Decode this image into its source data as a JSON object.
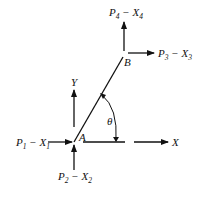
{
  "diagram": {
    "points": {
      "A": {
        "label": "A"
      },
      "B": {
        "label": "B"
      }
    },
    "axes": {
      "x_label": "X",
      "y_label": "Y"
    },
    "angle_label": "θ",
    "forces": [
      {
        "id": "1",
        "P": "P",
        "P_sub": "1",
        "dash": " − ",
        "X": "X",
        "X_sub": "1",
        "at": "A",
        "direction": "right"
      },
      {
        "id": "2",
        "P": "P",
        "P_sub": "2",
        "dash": " − ",
        "X": "X",
        "X_sub": "2",
        "at": "A",
        "direction": "up"
      },
      {
        "id": "3",
        "P": "P",
        "P_sub": "3",
        "dash": " − ",
        "X": "X",
        "X_sub": "3",
        "at": "B",
        "direction": "right"
      },
      {
        "id": "4",
        "P": "P",
        "P_sub": "4",
        "dash": " − ",
        "X": "X",
        "X_sub": "4",
        "at": "B",
        "direction": "up"
      }
    ],
    "colors": {
      "ink": "#111111",
      "background": "#ffffff"
    }
  }
}
